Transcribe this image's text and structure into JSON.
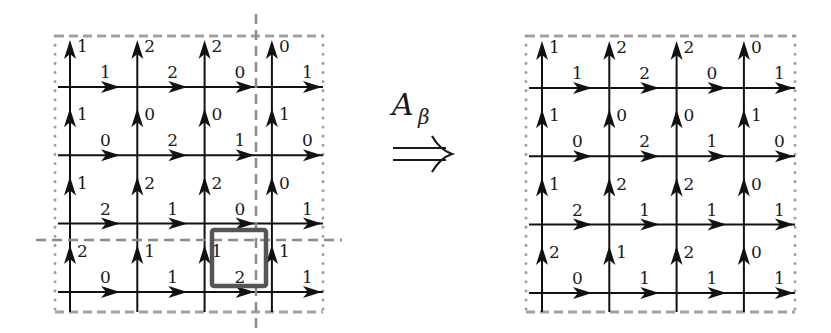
{
  "operator": {
    "symbol": "A",
    "subscript": "β",
    "arrow": "⇒"
  },
  "colors": {
    "line": "#111111",
    "dashed_border": "#a0a0a0",
    "cut_line": "#8a8a8a",
    "highlight_box": "#555555"
  },
  "grids": [
    {
      "name": "before",
      "origin": {
        "x": 70,
        "y": 87
      },
      "spacing": {
        "x": 67.3,
        "y": 68.3
      },
      "frame": {
        "left": 55,
        "top": 36,
        "right": 323,
        "bottom": 312
      },
      "cells": [
        [
          {
            "v": "1",
            "h": "1"
          },
          {
            "v": "2",
            "h": "2"
          },
          {
            "v": "2",
            "h": "0"
          },
          {
            "v": "0",
            "h": "1"
          }
        ],
        [
          {
            "v": "1",
            "h": "0"
          },
          {
            "v": "0",
            "h": "2"
          },
          {
            "v": "0",
            "h": "1"
          },
          {
            "v": "1",
            "h": "0"
          }
        ],
        [
          {
            "v": "1",
            "h": "2"
          },
          {
            "v": "2",
            "h": "1"
          },
          {
            "v": "2",
            "h": "0"
          },
          {
            "v": "0",
            "h": "1"
          }
        ],
        [
          {
            "v": "2",
            "h": "0"
          },
          {
            "v": "1",
            "h": "1"
          },
          {
            "v": "1",
            "h": "2"
          },
          {
            "v": "1",
            "h": "1"
          }
        ]
      ],
      "cuts": {
        "vertical": {
          "x": 256,
          "y1": 14,
          "y2": 332
        },
        "horizontal": {
          "y": 240,
          "x1": 36,
          "x2": 342
        }
      },
      "highlight": {
        "x": 212,
        "y": 230,
        "w": 54,
        "h": 56
      }
    },
    {
      "name": "after",
      "origin": {
        "x": 542,
        "y": 88
      },
      "spacing": {
        "x": 67.3,
        "y": 68.3
      },
      "frame": {
        "left": 526,
        "top": 36,
        "right": 795,
        "bottom": 312
      },
      "cells": [
        [
          {
            "v": "1",
            "h": "1"
          },
          {
            "v": "2",
            "h": "2"
          },
          {
            "v": "2",
            "h": "0"
          },
          {
            "v": "0",
            "h": "1"
          }
        ],
        [
          {
            "v": "1",
            "h": "0"
          },
          {
            "v": "0",
            "h": "2"
          },
          {
            "v": "0",
            "h": "1"
          },
          {
            "v": "1",
            "h": "0"
          }
        ],
        [
          {
            "v": "1",
            "h": "2"
          },
          {
            "v": "2",
            "h": "1"
          },
          {
            "v": "2",
            "h": "1"
          },
          {
            "v": "0",
            "h": "1"
          }
        ],
        [
          {
            "v": "2",
            "h": "0"
          },
          {
            "v": "1",
            "h": "1"
          },
          {
            "v": "2",
            "h": "1"
          },
          {
            "v": "0",
            "h": "1"
          }
        ]
      ],
      "cuts": null,
      "highlight": null
    }
  ]
}
